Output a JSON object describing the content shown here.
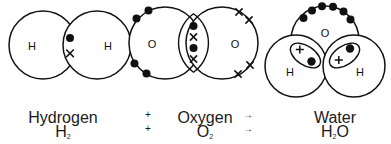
{
  "diagram": {
    "type": "chemical-bonding-dot-and-cross",
    "molecules": [
      {
        "id": "hydrogen",
        "name": "Hydrogen",
        "formula_text": "H",
        "formula_sub": "2",
        "atom_labels": [
          "H",
          "H"
        ],
        "bond": "single covalent",
        "shared_electrons": 2,
        "shared_marks": [
          "dot",
          "cross"
        ],
        "lone_pairs": 0
      },
      {
        "id": "oxygen",
        "name": "Oxygen",
        "formula_text": "O",
        "formula_sub": "2",
        "atom_labels": [
          "O",
          "O"
        ],
        "bond": "double covalent",
        "shared_electrons": 4,
        "shared_marks": [
          "dot",
          "cross",
          "dot",
          "cross"
        ],
        "left_atom_outer_dots": 4,
        "right_atom_outer_crosses": 4
      },
      {
        "id": "water",
        "name": "Water",
        "formula_text": "H",
        "formula_sub": "2",
        "formula_tail": "O",
        "atom_labels": [
          "O",
          "H",
          "H"
        ],
        "bond": "two single covalent",
        "oxygen_lone_pair_dots": 6,
        "shared_marks_per_bond": [
          "plus",
          "dot"
        ]
      }
    ],
    "operators": {
      "plus": "+",
      "arrow": "→"
    },
    "colors": {
      "stroke": "#111111",
      "background": "#ffffff",
      "text": "#1f1f1f"
    }
  }
}
